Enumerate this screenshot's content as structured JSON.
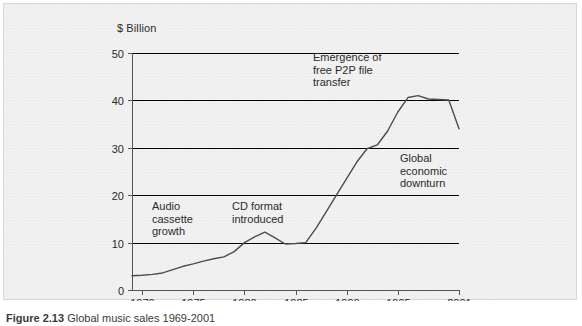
{
  "figure": {
    "caption_number": "Figure 2.13",
    "caption_text": "Global music sales 1969-2001",
    "unit_label": "$ Billion"
  },
  "annotations": [
    {
      "id": "audio-cassette",
      "text": "Audio\ncassette\ngrowth"
    },
    {
      "id": "cd-format",
      "text": "CD format\nintroduced"
    },
    {
      "id": "p2p",
      "text": "Emergence of\nfree P2P file\ntransfer"
    },
    {
      "id": "downturn",
      "text": "Global\neconomic\ndownturn"
    }
  ],
  "colors": {
    "background": "#f2f2f2",
    "frame_border": "#d8d8d8",
    "gridline": "#000000",
    "axis": "#555555",
    "series_line": "#4d4d4d",
    "text": "#2b2b2b"
  },
  "chart_data": {
    "type": "line",
    "title": "",
    "subtitle": "",
    "xlabel": "",
    "ylabel": "$ Billion",
    "xlim": [
      1969,
      2001
    ],
    "ylim": [
      0,
      50
    ],
    "grid": true,
    "grid_axis": "y",
    "legend": false,
    "legend_position": "none",
    "ytick_labels": [
      "0",
      "10",
      "20",
      "30",
      "40",
      "50"
    ],
    "yticks": [
      0,
      10,
      20,
      30,
      40,
      50
    ],
    "xtick_labels": [
      "1970",
      "1975",
      "1980",
      "1985",
      "1990",
      "1995",
      "2001"
    ],
    "xticks": [
      1970,
      1975,
      1980,
      1985,
      1990,
      1995,
      2001
    ],
    "series": [
      {
        "name": "Global music sales",
        "x": [
          1969,
          1970,
          1971,
          1972,
          1973,
          1974,
          1975,
          1976,
          1977,
          1978,
          1979,
          1980,
          1981,
          1982,
          1983,
          1984,
          1985,
          1986,
          1987,
          1988,
          1989,
          1990,
          1991,
          1992,
          1993,
          1994,
          1995,
          1996,
          1997,
          1998,
          1999,
          2000,
          2001
        ],
        "values": [
          3.0,
          3.1,
          3.3,
          3.6,
          4.3,
          5.0,
          5.5,
          6.1,
          6.6,
          7.0,
          8.1,
          10.0,
          11.2,
          12.2,
          11.0,
          9.7,
          9.8,
          10.0,
          13.0,
          16.5,
          20.0,
          23.5,
          27.0,
          29.8,
          30.6,
          33.5,
          37.5,
          40.6,
          41.0,
          40.3,
          40.2,
          40.1,
          34.0
        ]
      }
    ]
  }
}
